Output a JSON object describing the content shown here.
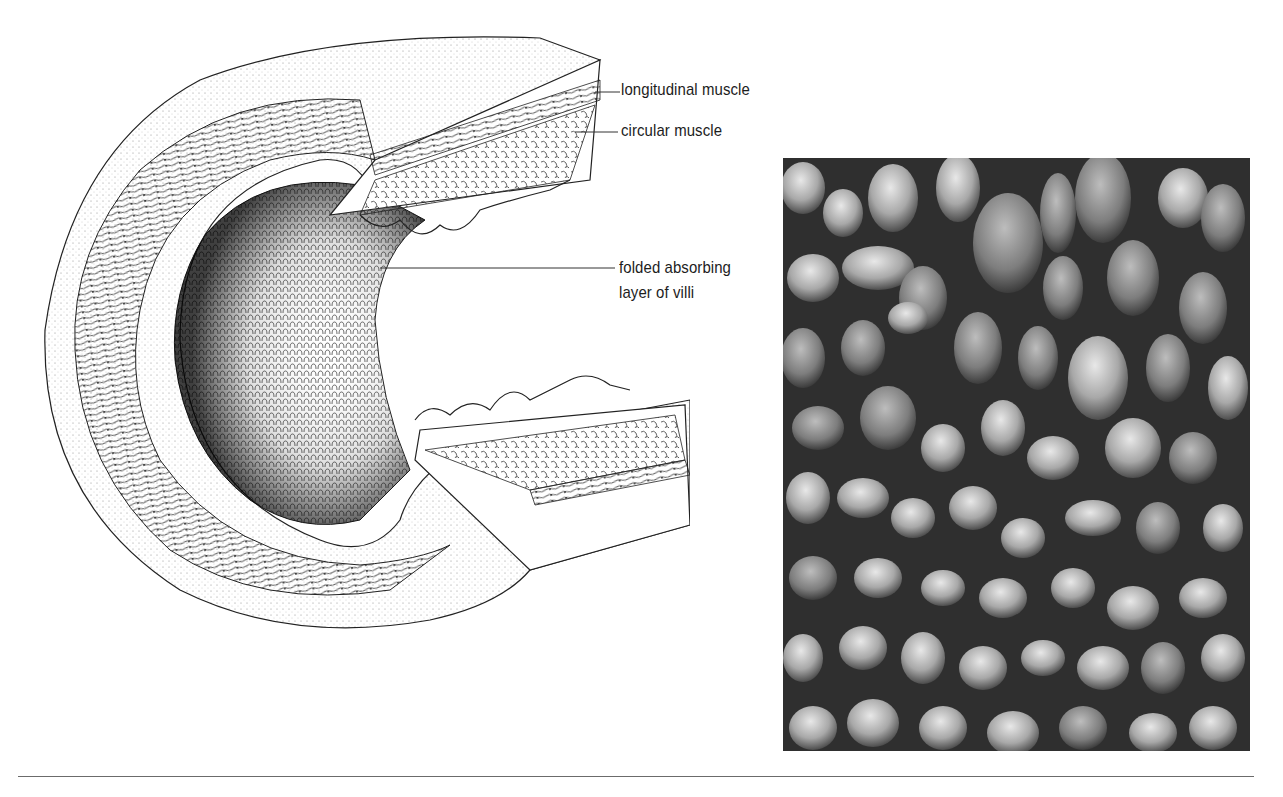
{
  "figure": {
    "diagram": {
      "title": "Cross-section of small intestine wall",
      "labels": [
        {
          "id": "longitudinal",
          "text": "longitudinal muscle"
        },
        {
          "id": "circular",
          "text": "circular muscle"
        },
        {
          "id": "villi_1",
          "text": "folded absorbing"
        },
        {
          "id": "villi_2",
          "text": "layer of villi"
        }
      ]
    },
    "photo": {
      "subject": "scanning electron micrograph of intestinal villi"
    },
    "colors": {
      "ink": "#1d1d1d",
      "rule": "#6b6b6b",
      "background": "#ffffff"
    }
  }
}
